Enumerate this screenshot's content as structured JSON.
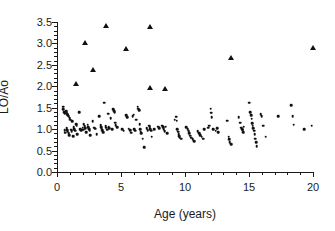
{
  "chart_data": {
    "type": "scatter",
    "title": "",
    "xlabel": "Age (years)",
    "ylabel": "LO/Ao",
    "xlim": [
      0,
      20
    ],
    "ylim": [
      0,
      3.5
    ],
    "xticks": [
      0,
      5,
      10,
      15,
      20
    ],
    "xtick_labels": [
      "0",
      "5",
      "10",
      "15",
      "20"
    ],
    "xminor_step": 1,
    "yticks": [
      0.0,
      0.5,
      1.0,
      1.5,
      2.0,
      2.5,
      3.0,
      3.5
    ],
    "ytick_labels": [
      "0.0",
      "0.5",
      "1.0",
      "1.5",
      "2.0",
      "2.5",
      "3.0",
      "3.5"
    ],
    "yminor_step": 0.1,
    "grid": false,
    "legend": null,
    "marker_color": "#111111",
    "axis_color": "#1a1a1a",
    "background": "#ffffff",
    "series": [
      {
        "name": "Normal",
        "marker": "circle",
        "color": "#111111",
        "points": [
          [
            0.5,
            1.52
          ],
          [
            0.5,
            1.46
          ],
          [
            0.55,
            1.4
          ],
          [
            0.6,
            1.36
          ],
          [
            0.6,
            0.98
          ],
          [
            0.62,
            0.92
          ],
          [
            0.7,
            1.42
          ],
          [
            0.72,
            1.38
          ],
          [
            0.75,
            1.36
          ],
          [
            0.8,
            1.35
          ],
          [
            0.85,
            1.33
          ],
          [
            0.9,
            1.3
          ],
          [
            0.75,
            1.02
          ],
          [
            0.8,
            0.97
          ],
          [
            0.85,
            0.94
          ],
          [
            0.9,
            0.9
          ],
          [
            0.95,
            0.86
          ],
          [
            1.0,
            1.25
          ],
          [
            1.05,
            1.22
          ],
          [
            1.1,
            0.99
          ],
          [
            1.15,
            0.95
          ],
          [
            1.2,
            1.18
          ],
          [
            1.25,
            0.83
          ],
          [
            1.3,
            1.05
          ],
          [
            1.35,
            1.0
          ],
          [
            1.4,
            0.96
          ],
          [
            1.5,
            1.12
          ],
          [
            1.55,
            1.08
          ],
          [
            1.6,
            0.88
          ],
          [
            1.75,
            1.39
          ],
          [
            1.8,
            1.0
          ],
          [
            1.9,
            0.97
          ],
          [
            2.0,
            1.03
          ],
          [
            2.05,
            0.99
          ],
          [
            2.1,
            1.12
          ],
          [
            2.15,
            1.07
          ],
          [
            2.2,
            1.02
          ],
          [
            2.3,
            0.93
          ],
          [
            2.4,
            1.1
          ],
          [
            2.45,
            1.05
          ],
          [
            2.5,
            1.0
          ],
          [
            2.55,
            0.96
          ],
          [
            2.6,
            0.86
          ],
          [
            2.8,
            1.18
          ],
          [
            2.9,
            1.03
          ],
          [
            3.0,
            1.01
          ],
          [
            3.1,
            0.88
          ],
          [
            3.3,
            1.3
          ],
          [
            3.4,
            1.09
          ],
          [
            3.45,
            1.05
          ],
          [
            3.5,
            1.01
          ],
          [
            3.55,
            0.97
          ],
          [
            3.6,
            0.93
          ],
          [
            3.7,
            1.62
          ],
          [
            3.8,
            1.07
          ],
          [
            3.85,
            1.03
          ],
          [
            3.9,
            0.99
          ],
          [
            4.0,
            1.36
          ],
          [
            4.05,
            1.06
          ],
          [
            4.1,
            1.02
          ],
          [
            4.2,
            1.26
          ],
          [
            4.3,
            1.0
          ],
          [
            4.4,
            1.47
          ],
          [
            4.45,
            1.42
          ],
          [
            4.5,
            1.38
          ],
          [
            4.55,
            1.15
          ],
          [
            4.6,
            1.09
          ],
          [
            4.7,
            1.04
          ],
          [
            5.1,
            1.0
          ],
          [
            5.2,
            0.96
          ],
          [
            5.4,
            1.32
          ],
          [
            5.5,
            1.28
          ],
          [
            5.6,
            1.01
          ],
          [
            5.7,
            0.97
          ],
          [
            5.8,
            0.92
          ],
          [
            5.9,
            1.3
          ],
          [
            6.0,
            1.34
          ],
          [
            6.05,
            1.0
          ],
          [
            6.1,
            0.96
          ],
          [
            6.2,
            1.22
          ],
          [
            6.3,
            1.52
          ],
          [
            6.35,
            1.48
          ],
          [
            6.4,
            1.44
          ],
          [
            6.45,
            1.12
          ],
          [
            6.5,
            1.0
          ],
          [
            6.55,
            0.94
          ],
          [
            6.6,
            0.9
          ],
          [
            6.7,
            0.78
          ],
          [
            6.8,
            0.58
          ],
          [
            7.0,
            1.02
          ],
          [
            7.1,
            0.98
          ],
          [
            7.2,
            1.08
          ],
          [
            7.25,
            1.04
          ],
          [
            7.3,
            1.0
          ],
          [
            7.35,
            0.96
          ],
          [
            7.4,
            0.82
          ],
          [
            7.6,
            1.0
          ],
          [
            7.9,
            1.06
          ],
          [
            8.0,
            1.02
          ],
          [
            8.2,
            1.08
          ],
          [
            8.3,
            1.04
          ],
          [
            8.35,
            1.0
          ],
          [
            8.4,
            0.95
          ],
          [
            8.5,
            1.06
          ],
          [
            8.6,
            0.9
          ],
          [
            9.2,
            1.22
          ],
          [
            9.3,
            1.29
          ],
          [
            9.35,
            1.2
          ],
          [
            9.4,
            1.0
          ],
          [
            9.45,
            0.94
          ],
          [
            9.5,
            0.88
          ],
          [
            9.55,
            0.84
          ],
          [
            9.6,
            0.8
          ],
          [
            9.7,
            0.78
          ],
          [
            10.1,
            1.05
          ],
          [
            10.2,
            1.0
          ],
          [
            10.3,
            0.95
          ],
          [
            10.35,
            0.9
          ],
          [
            10.4,
            0.85
          ],
          [
            10.5,
            0.8
          ],
          [
            10.6,
            0.76
          ],
          [
            10.7,
            0.72
          ],
          [
            11.0,
            0.95
          ],
          [
            11.1,
            0.9
          ],
          [
            11.2,
            0.86
          ],
          [
            11.3,
            0.82
          ],
          [
            11.4,
            0.78
          ],
          [
            11.5,
            1.0
          ],
          [
            11.8,
            1.03
          ],
          [
            11.9,
            1.08
          ],
          [
            12.0,
            1.48
          ],
          [
            12.05,
            1.38
          ],
          [
            12.1,
            1.28
          ],
          [
            12.2,
            1.0
          ],
          [
            12.4,
            0.96
          ],
          [
            12.5,
            1.02
          ],
          [
            12.6,
            0.93
          ],
          [
            13.3,
            1.2
          ],
          [
            13.4,
            0.82
          ],
          [
            13.45,
            0.76
          ],
          [
            13.5,
            0.7
          ],
          [
            13.6,
            0.65
          ],
          [
            14.2,
            1.28
          ],
          [
            14.3,
            1.15
          ],
          [
            14.4,
            1.03
          ],
          [
            14.45,
            1.0
          ],
          [
            14.5,
            0.97
          ],
          [
            14.55,
            0.93
          ],
          [
            14.6,
            1.06
          ],
          [
            15.0,
            1.62
          ],
          [
            15.1,
            1.4
          ],
          [
            15.15,
            1.32
          ],
          [
            15.2,
            1.24
          ],
          [
            15.25,
            1.14
          ],
          [
            15.3,
            1.08
          ],
          [
            15.35,
            1.02
          ],
          [
            15.4,
            0.96
          ],
          [
            15.45,
            0.88
          ],
          [
            15.5,
            0.78
          ],
          [
            15.55,
            0.7
          ],
          [
            15.6,
            0.6
          ],
          [
            15.9,
            1.35
          ],
          [
            16.0,
            1.3
          ],
          [
            16.1,
            1.08
          ],
          [
            16.3,
            0.82
          ],
          [
            17.3,
            1.3
          ],
          [
            18.3,
            1.56
          ],
          [
            18.4,
            1.3
          ],
          [
            18.5,
            1.1
          ],
          [
            19.3,
            1.0
          ],
          [
            19.9,
            1.08
          ]
        ]
      },
      {
        "name": "Outlier",
        "marker": "triangle",
        "color": "#111111",
        "points": [
          [
            1.5,
            2.05
          ],
          [
            2.2,
            3.0
          ],
          [
            2.8,
            2.37
          ],
          [
            3.8,
            3.4
          ],
          [
            5.4,
            2.88
          ],
          [
            7.3,
            3.38
          ],
          [
            7.3,
            1.95
          ],
          [
            8.4,
            1.94
          ],
          [
            13.6,
            2.67
          ],
          [
            20.0,
            2.9
          ]
        ]
      }
    ]
  }
}
